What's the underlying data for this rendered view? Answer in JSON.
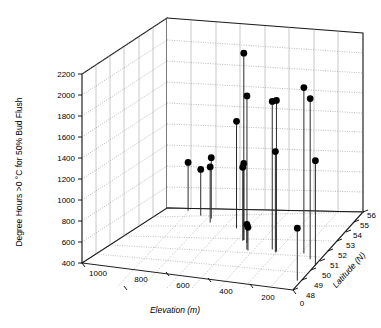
{
  "chart_data": {
    "type": "scatter",
    "projection": "3d-stem",
    "title": "",
    "xlabel": "Elevation (m)",
    "ylabel": "Latitude (N)",
    "zlabel": "Degree Hours >0 °C for 50% Bud Flush",
    "x_ticks": [
      1000,
      800,
      600,
      400,
      200,
      0
    ],
    "x_tick_labels": [
      "1000",
      "800",
      "600",
      "400",
      "200",
      "0"
    ],
    "xlim": [
      1000,
      0
    ],
    "y_ticks": [
      48,
      49,
      50,
      51,
      52,
      53,
      54,
      55,
      56
    ],
    "y_tick_labels": [
      "48",
      "49",
      "50",
      "51",
      "52",
      "53",
      "54",
      "55",
      "56"
    ],
    "ylim": [
      48,
      56
    ],
    "z_ticks": [
      400,
      600,
      800,
      1000,
      1200,
      1400,
      1600,
      1800,
      2000,
      2200
    ],
    "z_tick_labels": [
      "400",
      "600",
      "800",
      "1000",
      "1200",
      "1400",
      "1600",
      "1800",
      "2000",
      "2200"
    ],
    "zlim": [
      400,
      2200
    ],
    "grid": true,
    "legend": false,
    "marker": "filled-circle",
    "marker_color": "#000000",
    "stem_color": "#2b2b2b",
    "points": [
      {
        "elevation": 900,
        "latitude": 56.0,
        "degree_hours": 860
      },
      {
        "elevation": 820,
        "latitude": 55.6,
        "degree_hours": 840
      },
      {
        "elevation": 760,
        "latitude": 55.4,
        "degree_hours": 980
      },
      {
        "elevation": 740,
        "latitude": 54.9,
        "degree_hours": 930
      },
      {
        "elevation": 600,
        "latitude": 54.6,
        "degree_hours": 1420
      },
      {
        "elevation": 500,
        "latitude": 53.3,
        "degree_hours": 2180
      },
      {
        "elevation": 500,
        "latitude": 53.3,
        "degree_hours": 1130
      },
      {
        "elevation": 500,
        "latitude": 53.2,
        "degree_hours": 1100
      },
      {
        "elevation": 470,
        "latitude": 53.0,
        "degree_hours": 1800
      },
      {
        "elevation": 430,
        "latitude": 52.2,
        "degree_hours": 640
      },
      {
        "elevation": 420,
        "latitude": 52.1,
        "degree_hours": 620
      },
      {
        "elevation": 330,
        "latitude": 52.6,
        "degree_hours": 1810
      },
      {
        "elevation": 300,
        "latitude": 52.4,
        "degree_hours": 1840
      },
      {
        "elevation": 300,
        "latitude": 52.3,
        "degree_hours": 1360
      },
      {
        "elevation": 180,
        "latitude": 52.6,
        "degree_hours": 1980
      },
      {
        "elevation": 120,
        "latitude": 52.0,
        "degree_hours": 1930
      },
      {
        "elevation": 60,
        "latitude": 51.3,
        "degree_hours": 1400
      },
      {
        "elevation": 40,
        "latitude": 49.2,
        "degree_hours": 900
      }
    ]
  },
  "axes": {
    "z_title": "Degree Hours >0 °C for 50% Bud Flush",
    "x_title": "Elevation (m)",
    "y_title": "Latitude (N)"
  }
}
